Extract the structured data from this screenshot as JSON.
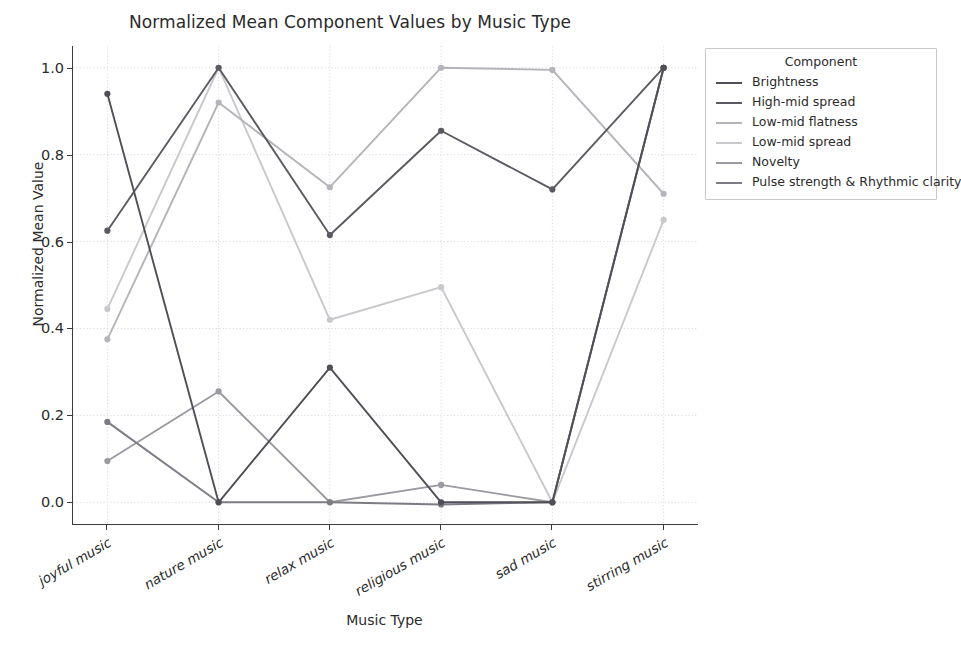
{
  "chart_data": {
    "type": "line",
    "title": "Normalized Mean Component Values by Music Type",
    "xlabel": "Music Type",
    "ylabel": "Normalized Mean Value",
    "legend_title": "Component",
    "legend_position": "upper right outside",
    "grid": true,
    "categories": [
      "joyful music",
      "nature music",
      "relax music",
      "religious music",
      "sad music",
      "stirring music"
    ],
    "ylim": [
      -0.05,
      1.05
    ],
    "yticks": [
      "0.0",
      "0.2",
      "0.4",
      "0.6",
      "0.8",
      "1.0"
    ],
    "ytick_values": [
      0.0,
      0.2,
      0.4,
      0.6,
      0.8,
      1.0
    ],
    "series": [
      {
        "name": "Brightness",
        "color": "#4f4f57",
        "values": [
          0.94,
          0.0,
          0.31,
          0.0,
          0.0,
          1.0
        ]
      },
      {
        "name": "High-mid spread",
        "color": "#5a5a62",
        "values": [
          0.625,
          1.0,
          0.615,
          0.855,
          0.72,
          1.0
        ]
      },
      {
        "name": "Low-mid flatness",
        "color": "#b4b4ba",
        "values": [
          0.375,
          0.92,
          0.725,
          1.0,
          0.995,
          0.71
        ]
      },
      {
        "name": "Low-mid spread",
        "color": "#c8c8cd",
        "values": [
          0.445,
          1.0,
          0.42,
          0.495,
          0.0,
          0.65
        ]
      },
      {
        "name": "Novelty",
        "color": "#9a9aa2",
        "values": [
          0.095,
          0.255,
          0.0,
          0.04,
          0.0,
          1.0
        ]
      },
      {
        "name": "Pulse strength & Rhythmic clarity",
        "color": "#7c7c85",
        "values": [
          0.185,
          0.0,
          0.0,
          -0.005,
          0.0,
          1.0
        ]
      }
    ]
  }
}
